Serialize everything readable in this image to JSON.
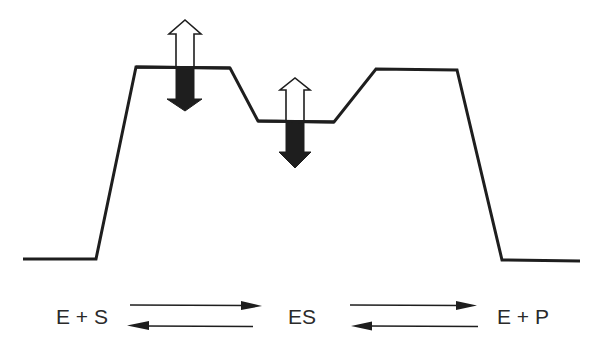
{
  "diagram": {
    "type": "energy-profile",
    "colors": {
      "line": "#1e1e1e",
      "filled_arrow": "#1e1e1e",
      "hollow_arrow_fill": "#ffffff",
      "text": "#2a2a2a",
      "background": "#ffffff"
    },
    "profile_points": [
      [
        23,
        259
      ],
      [
        96,
        259
      ],
      [
        136,
        67
      ],
      [
        230,
        68
      ],
      [
        258,
        121
      ],
      [
        334,
        122
      ],
      [
        376,
        69
      ],
      [
        457,
        70
      ],
      [
        502,
        260
      ],
      [
        580,
        261
      ]
    ],
    "level_arrows": [
      {
        "name": "transition-state-1",
        "x": 185,
        "level_y": 67,
        "up_arrow": {
          "style": "hollow",
          "tip_y": 20,
          "head_base_y": 34
        },
        "down_arrow": {
          "style": "filled",
          "head_base_y": 99,
          "tip_y": 111
        }
      },
      {
        "name": "es-complex",
        "x": 295,
        "level_y": 121,
        "up_arrow": {
          "style": "hollow",
          "tip_y": 78,
          "head_base_y": 90
        },
        "down_arrow": {
          "style": "filled",
          "head_base_y": 152,
          "tip_y": 168
        }
      }
    ],
    "states": [
      {
        "id": "reactants",
        "label": "E + S"
      },
      {
        "id": "complex",
        "label": "ES"
      },
      {
        "id": "products",
        "label": "E + P"
      }
    ],
    "equilibria": [
      {
        "from": "E + S",
        "to": "ES",
        "forward": true,
        "reverse": true
      },
      {
        "from": "ES",
        "to": "E + P",
        "forward": true,
        "reverse": true
      }
    ]
  }
}
